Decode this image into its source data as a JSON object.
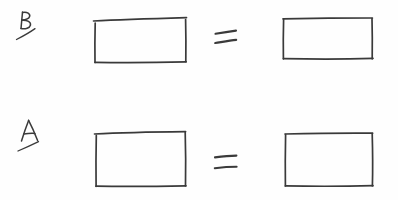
{
  "canvas": {
    "width": 398,
    "height": 200,
    "background_color": "#fefefe",
    "ink_color": "#3a3a3a",
    "medium": "pencil-on-white-paper",
    "title": "Two hand-drawn equations of blank rectangles"
  },
  "chart_data": {
    "type": "diagram",
    "title": "Two hand-drawn equations of blank rectangles",
    "rows": [
      {
        "label": "B",
        "label_has_underline_slash": true,
        "relation": "=",
        "left_shape": "rectangle",
        "right_shape": "rectangle",
        "left_contents": "",
        "right_contents": ""
      },
      {
        "label": "A",
        "label_has_underline_slash": true,
        "relation": "=",
        "left_shape": "rectangle",
        "right_shape": "rectangle",
        "left_contents": "",
        "right_contents": ""
      }
    ]
  },
  "rows": [
    {
      "id": "row-b",
      "label": "B",
      "operator": "=",
      "left_box": {
        "name": "rectangle-b-left",
        "label": ""
      },
      "right_box": {
        "name": "rectangle-b-right",
        "label": ""
      }
    },
    {
      "id": "row-a",
      "label": "A",
      "operator": "=",
      "left_box": {
        "name": "rectangle-a-left",
        "label": ""
      },
      "right_box": {
        "name": "rectangle-a-right",
        "label": ""
      }
    }
  ]
}
